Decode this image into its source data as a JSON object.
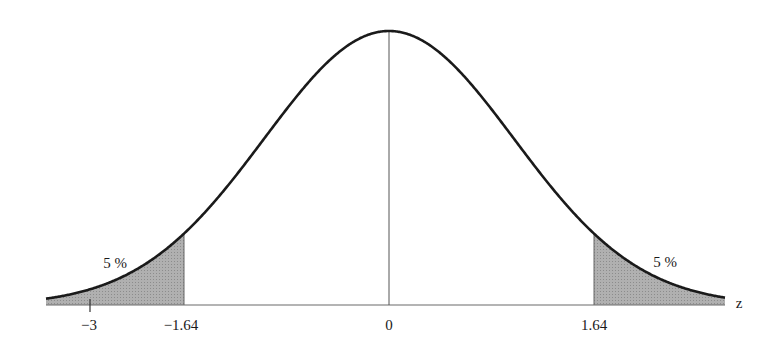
{
  "chart_data": {
    "type": "area",
    "title": "",
    "xlabel": "z",
    "ylabel": "",
    "distribution": "standard normal",
    "xlim": [
      -3.0,
      2.65
    ],
    "x_ticks": [
      {
        "value": -3,
        "label": "−3"
      },
      {
        "value": -1.64,
        "label": "−1.64"
      },
      {
        "value": 0,
        "label": "0"
      },
      {
        "value": 1.64,
        "label": "1.64"
      }
    ],
    "shaded_regions": [
      {
        "from": -3.0,
        "to": -1.64,
        "label": "5 %",
        "side": "left"
      },
      {
        "from": 1.64,
        "to": 2.65,
        "label": "5 %",
        "side": "right"
      }
    ],
    "center_line": 0,
    "grid": false,
    "legend": null
  },
  "labels": {
    "axis_name": "z",
    "tick_neg3": "−3",
    "tick_neg164": "−1.64",
    "tick_0": "0",
    "tick_164": "1.64",
    "left_tail": "5 %",
    "right_tail": "5 %"
  },
  "colors": {
    "curve": "#1a1a1a",
    "shade": "#a9a9a9",
    "axis": "#555555"
  }
}
